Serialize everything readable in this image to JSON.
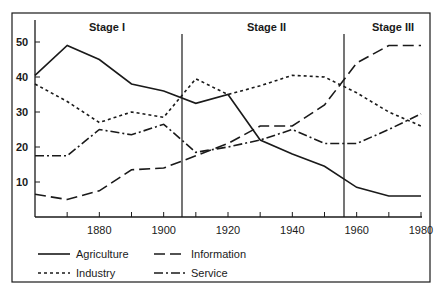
{
  "chart_data": {
    "type": "line",
    "title": "",
    "xlabel": "",
    "ylabel": "",
    "x": [
      1860,
      1870,
      1880,
      1890,
      1900,
      1910,
      1920,
      1930,
      1940,
      1950,
      1960,
      1970,
      1980
    ],
    "xlim": [
      1860,
      1980
    ],
    "ylim": [
      0,
      55
    ],
    "x_tick_labels": [
      "1880",
      "1900",
      "1920",
      "1940",
      "1960",
      "1980"
    ],
    "x_tick_values": [
      1880,
      1900,
      1920,
      1940,
      1960,
      1980
    ],
    "y_tick_labels": [
      "10",
      "20",
      "30",
      "40",
      "50"
    ],
    "y_tick_values": [
      10,
      20,
      30,
      40,
      50
    ],
    "grid": false,
    "legend_position": "bottom",
    "series": [
      {
        "name": "Agriculture",
        "style": "solid",
        "values": [
          40.5,
          49,
          45,
          38,
          36,
          32.5,
          35,
          22,
          18,
          14.5,
          8.5,
          6,
          6
        ]
      },
      {
        "name": "Industry",
        "style": "dotted",
        "values": [
          38,
          33,
          27,
          30,
          28.5,
          39.5,
          35,
          37.5,
          40.5,
          40,
          35.5,
          30,
          26
        ]
      },
      {
        "name": "Information",
        "style": "dashed",
        "values": [
          6.5,
          5,
          7.5,
          13.5,
          14,
          17.5,
          21,
          26,
          26,
          32,
          44,
          49,
          49
        ]
      },
      {
        "name": "Service",
        "style": "dashdot",
        "values": [
          17.5,
          17.5,
          25,
          23.5,
          26.5,
          18.5,
          20,
          22,
          25,
          21,
          21,
          25,
          29.5
        ]
      }
    ],
    "annotations": [
      {
        "type": "vline",
        "x": 1905,
        "label": ""
      },
      {
        "type": "vline",
        "x": 1955,
        "label": ""
      },
      {
        "type": "text",
        "label": "Stage I",
        "x": 1878
      },
      {
        "type": "text",
        "label": "Stage II",
        "x": 1930
      },
      {
        "type": "text",
        "label": "Stage III",
        "x": 1972
      }
    ]
  },
  "stages": [
    "Stage I",
    "Stage II",
    "Stage III"
  ],
  "legend": {
    "agriculture": "Agriculture",
    "information": "Information",
    "industry": "Industry",
    "service": "Service"
  },
  "colors": {
    "ink": "#1a1a1a",
    "background": "#ffffff"
  }
}
